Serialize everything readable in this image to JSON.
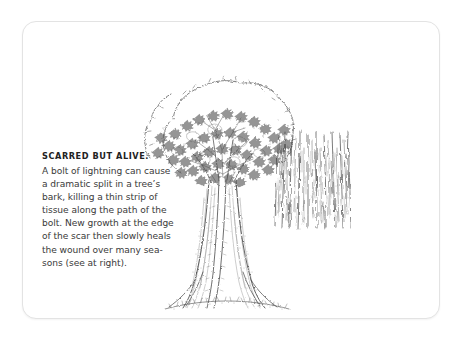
{
  "card": {
    "background_color": "#ffffff",
    "border_color": "#e3e3e3"
  },
  "caption": {
    "heading": "SCARRED BUT ALIVE.",
    "body_lines": [
      "A bolt of lightning can cause",
      "a dramatic split in a tree’s",
      "bark, killing a thin strip of",
      "tissue along the path of the",
      "bolt. New growth at the edge",
      "of the scar then slowly heals",
      "the wound over many sea-",
      "sons (see at right)."
    ],
    "body_text": "A bolt of lightning can cause a dramatic split in a tree’s bark, killing a thin strip of tissue along the path of the bolt. New growth at the edge of the scar then slowly heals the wound over many seasons (see at right).",
    "heading_color": "#222222",
    "body_color": "#3a3a3a"
  },
  "illustration": {
    "ink_color": "#4a4a4a",
    "tree": {
      "label": "lightning-scarred-tree-drawing",
      "description": "Pen-and-ink drawing of a broad deciduous tree with a sketchy irregular canopy outline, dense stippled foliage, a thick buttressed trunk bearing a pale vertical lightning scar, and a sketched grass line at its base."
    },
    "bark_detail": {
      "label": "bark-scar-closeup-drawing",
      "description": "Close-up panel of vertical bark striations showing the healing scar ridges."
    }
  }
}
